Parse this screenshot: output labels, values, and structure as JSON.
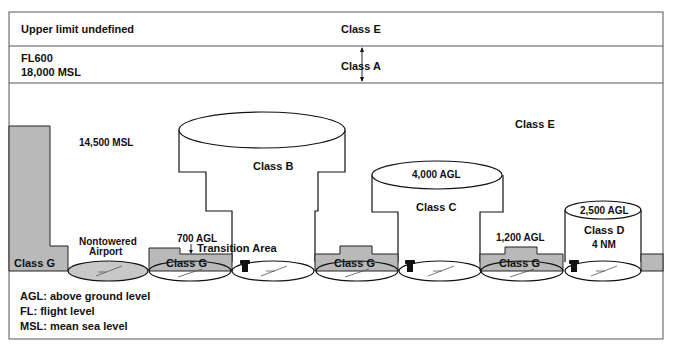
{
  "bands": {
    "top": {
      "left_label": "Upper limit undefined",
      "class_label": "Class E"
    },
    "middle": {
      "left_label_line1": "FL600",
      "left_label_line2": "18,000 MSL",
      "class_label": "Class A"
    }
  },
  "airspace": {
    "class_e_label": "Class E",
    "mid_altitude": "14,500 MSL",
    "class_b": {
      "label": "Class B"
    },
    "class_c": {
      "label": "Class C",
      "ceiling": "4,000 AGL"
    },
    "class_d": {
      "label": "Class D",
      "radius": "4 NM",
      "ceiling": "2,500 AGL"
    },
    "class_g_labels": [
      "Class G",
      "Class G",
      "Class G",
      "Class G"
    ],
    "nontowered_line1": "Nontowered",
    "nontowered_line2": "Airport",
    "transition_altitude": "700 AGL",
    "transition_label": "Transition Area",
    "class_e_floor_near_c": "1,200 AGL"
  },
  "legend": [
    "AGL: above ground level",
    "FL: flight level",
    "MSL: mean sea level"
  ],
  "colors": {
    "class_g_fill": "#b9b9b9",
    "line": "#111111",
    "background": "#ffffff"
  }
}
